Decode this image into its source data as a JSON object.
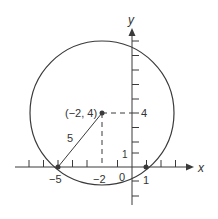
{
  "diagram": {
    "colors": {
      "stroke": "#3a3a3a",
      "background": "#ffffff"
    },
    "axes": {
      "x_label": "x",
      "y_label": "y"
    },
    "circle": {
      "center_label": "(−2, 4)",
      "radius_label": "5"
    },
    "tick_labels": {
      "x_neg5": "−5",
      "x_neg2": "−2",
      "origin": "0",
      "x_1": "1",
      "y_1": "1",
      "y_4": "4"
    }
  }
}
